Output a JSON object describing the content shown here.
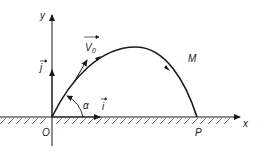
{
  "diagram": {
    "type": "projectile-motion",
    "labels": {
      "origin": "O",
      "landing_point": "P",
      "moving_point": "M",
      "x_axis": "x",
      "y_axis": "y",
      "initial_velocity": "V",
      "initial_velocity_subscript": "0",
      "unit_vector_x": "i",
      "unit_vector_y": "j",
      "angle": "α"
    },
    "colors": {
      "stroke": "#1a1a1a",
      "ground_hatch": "#555555",
      "background": "#ffffff"
    }
  }
}
